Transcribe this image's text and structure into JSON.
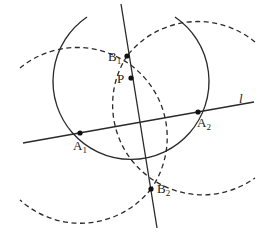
{
  "diagram": {
    "type": "geometric-construction",
    "line_label": "l",
    "points": {
      "B1": {
        "label": "B",
        "sub": "1"
      },
      "P": {
        "label": "P",
        "sub": ""
      },
      "A1": {
        "label": "A",
        "sub": "1"
      },
      "A2": {
        "label": "A",
        "sub": "2"
      },
      "B2": {
        "label": "B",
        "sub": "2"
      }
    },
    "elements": [
      {
        "kind": "line",
        "name": "l",
        "style": "solid"
      },
      {
        "kind": "line",
        "name": "perpendicular through P",
        "style": "solid"
      },
      {
        "kind": "arc",
        "name": "circle centered P through A1 and A2",
        "style": "solid"
      },
      {
        "kind": "arc",
        "name": "circle centered A1 through B1 and B2",
        "style": "dashed"
      },
      {
        "kind": "arc",
        "name": "circle centered A2 through B1 and B2",
        "style": "dashed"
      }
    ],
    "colors": {
      "stroke": "#2a2a2a",
      "background": "#ffffff"
    }
  }
}
